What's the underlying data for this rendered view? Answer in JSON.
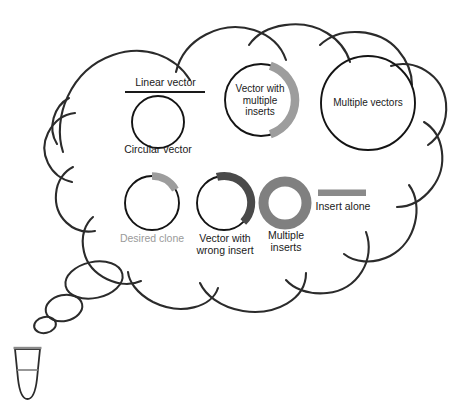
{
  "figure": {
    "container_shape": "thought-bubble",
    "tube_label": "microcentrifuge-tube"
  },
  "colors": {
    "outline": "#2b2b2b",
    "insert_desired": "#9d9d9d",
    "insert_multiple_vector": "#9d9d9d",
    "insert_wrong": "#4a4a4a",
    "multiple_inserts_ring": "#808080",
    "insert_alone_bar": "#8a8a8a",
    "text": "#1a1a1a",
    "text_muted": "#9a9a9a",
    "background": "#ffffff"
  },
  "items": [
    {
      "id": "linear-vector",
      "label": "Linear vector",
      "glyph": "horizontal-line",
      "label_position": "above"
    },
    {
      "id": "circular-vector",
      "label": "Circular vector",
      "glyph": "open-circle",
      "label_position": "below"
    },
    {
      "id": "vector-with-multiple-inserts",
      "label": "Vector with\nmultiple\ninserts",
      "glyph": "circle-with-large-gray-arc",
      "label_position": "inside"
    },
    {
      "id": "multiple-vectors",
      "label": "Multiple vectors",
      "glyph": "large-open-circle",
      "label_position": "inside"
    },
    {
      "id": "desired-clone",
      "label": "Desired clone",
      "glyph": "circle-with-small-light-gray-arc",
      "label_position": "below"
    },
    {
      "id": "vector-with-wrong-insert",
      "label": "Vector with\nwrong insert",
      "glyph": "circle-with-dark-gray-arc",
      "label_position": "below"
    },
    {
      "id": "multiple-inserts",
      "label": "Multiple\ninserts",
      "glyph": "thick-gray-ring",
      "label_position": "below"
    },
    {
      "id": "insert-alone",
      "label": "Insert alone",
      "glyph": "gray-bar",
      "label_position": "below"
    }
  ]
}
